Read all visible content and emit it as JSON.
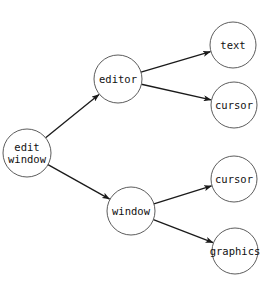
{
  "diagram": {
    "type": "tree",
    "direction": "left-to-right",
    "nodes": [
      {
        "id": "edit_window",
        "lines": [
          "edit",
          "window"
        ],
        "cx": 27,
        "cy": 153,
        "r": 24
      },
      {
        "id": "editor",
        "lines": [
          "editor"
        ],
        "cx": 118,
        "cy": 79,
        "r": 24
      },
      {
        "id": "text",
        "lines": [
          "text"
        ],
        "cx": 233,
        "cy": 45,
        "r": 23
      },
      {
        "id": "cursor_1",
        "lines": [
          "cursor"
        ],
        "cx": 234,
        "cy": 105,
        "r": 23
      },
      {
        "id": "window",
        "lines": [
          "window"
        ],
        "cx": 131,
        "cy": 211,
        "r": 24
      },
      {
        "id": "cursor_2",
        "lines": [
          "cursor"
        ],
        "cx": 234,
        "cy": 179,
        "r": 23
      },
      {
        "id": "graphics",
        "lines": [
          "graphics"
        ],
        "cx": 235,
        "cy": 251,
        "r": 23
      }
    ],
    "edges": [
      {
        "from": "edit_window",
        "to": "editor"
      },
      {
        "from": "edit_window",
        "to": "window"
      },
      {
        "from": "editor",
        "to": "text"
      },
      {
        "from": "editor",
        "to": "cursor_1"
      },
      {
        "from": "window",
        "to": "cursor_2"
      },
      {
        "from": "window",
        "to": "graphics"
      }
    ],
    "colors": {
      "edge": "#1a1a1a",
      "node_stroke": "#4a4a4a",
      "background": "#ffffff"
    }
  }
}
